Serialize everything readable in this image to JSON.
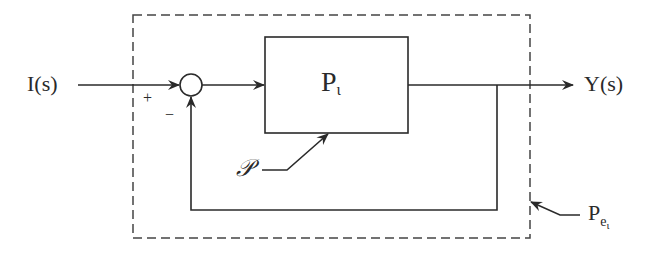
{
  "diagram": {
    "type": "block-diagram",
    "input": {
      "label": "I(s)"
    },
    "output": {
      "label": "Y(s)"
    },
    "summing_junction": {
      "plus_sign": "+",
      "minus_sign": "−"
    },
    "plant_block": {
      "label": "P",
      "subscript": "ι"
    },
    "uncertainty": {
      "label": "𝒫"
    },
    "enclosure": {
      "label": "P",
      "subscript": "e",
      "sub_subscript": "ι"
    },
    "colors": {
      "line": "#2a2a2a",
      "background": "#ffffff"
    }
  }
}
